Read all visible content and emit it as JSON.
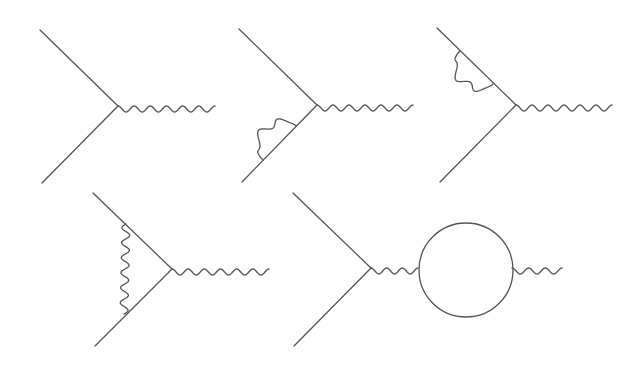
{
  "figure": {
    "stroke_color": "#555555",
    "background": "#ffffff"
  },
  "diagrams": [
    {
      "name": "tree-vertex",
      "vertex": [
        118,
        106
      ],
      "fermion_in": [
        [
          40,
          30
        ],
        [
          118,
          106
        ]
      ],
      "fermion_out": [
        [
          118,
          106
        ],
        [
          42,
          183
        ]
      ],
      "photon": {
        "from": [
          118,
          106
        ],
        "to": [
          215,
          106
        ],
        "waves": 6,
        "amp": 6
      },
      "corrections": []
    },
    {
      "name": "self-energy-lower-leg",
      "vertex": [
        317,
        105
      ],
      "fermion_in": [
        [
          239,
          29
        ],
        [
          317,
          105
        ]
      ],
      "fermion_out": [
        [
          317,
          105
        ],
        [
          242,
          182
        ]
      ],
      "photon": {
        "from": [
          317,
          105
        ],
        "to": [
          413,
          105
        ],
        "waves": 6,
        "amp": 6
      },
      "corrections": [
        {
          "type": "photon-arc",
          "from": [
            263,
            160
          ],
          "to": [
            296,
            126
          ],
          "side": "left",
          "waves": 3
        }
      ]
    },
    {
      "name": "self-energy-upper-leg",
      "vertex": [
        516,
        105
      ],
      "fermion_in": [
        [
          437,
          28
        ],
        [
          516,
          105
        ]
      ],
      "fermion_out": [
        [
          516,
          105
        ],
        [
          440,
          182
        ]
      ],
      "photon": {
        "from": [
          516,
          105
        ],
        "to": [
          612,
          105
        ],
        "waves": 6,
        "amp": 6
      },
      "corrections": [
        {
          "type": "photon-arc",
          "from": [
            460,
            51
          ],
          "to": [
            493,
            84
          ],
          "side": "left",
          "waves": 3
        }
      ]
    },
    {
      "name": "vertex-correction",
      "vertex": [
        172,
        269
      ],
      "fermion_in": [
        [
          93,
          193
        ],
        [
          172,
          269
        ]
      ],
      "fermion_out": [
        [
          172,
          269
        ],
        [
          95,
          346
        ]
      ],
      "photon": {
        "from": [
          172,
          269
        ],
        "to": [
          269,
          269
        ],
        "waves": 6,
        "amp": 6
      },
      "corrections": [
        {
          "type": "photon-exchange",
          "from": [
            126,
            224
          ],
          "to": [
            124,
            314
          ],
          "waves": 6
        }
      ]
    },
    {
      "name": "vacuum-polarization",
      "vertex": [
        371,
        268
      ],
      "fermion_in": [
        [
          293,
          193
        ],
        [
          371,
          268
        ]
      ],
      "fermion_out": [
        [
          371,
          268
        ],
        [
          294,
          346
        ]
      ],
      "photon": {
        "from": [
          371,
          268
        ],
        "to": [
          418,
          268
        ],
        "waves": 3,
        "amp": 6
      },
      "corrections": [
        {
          "type": "fermion-loop",
          "center": [
            466,
            270
          ],
          "radius": 47
        },
        {
          "type": "photon-out",
          "from": [
            512,
            268
          ],
          "to": [
            562,
            268
          ],
          "waves": 3
        }
      ]
    }
  ]
}
